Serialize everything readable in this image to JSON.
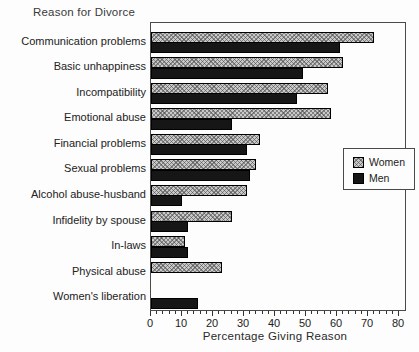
{
  "chart_data": {
    "type": "bar",
    "orientation": "horizontal",
    "title": "Reason for Divorce",
    "xlabel": "Percentage Giving Reason",
    "xlim": [
      0,
      80
    ],
    "xticks": [
      0,
      10,
      20,
      30,
      40,
      50,
      60,
      70,
      80
    ],
    "minor_tick_step": 2,
    "grid": false,
    "legend_position": "right-middle",
    "categories": [
      "Communication problems",
      "Basic unhappiness",
      "Incompatibility",
      "Emotional abuse",
      "Financial problems",
      "Sexual problems",
      "Alcohol abuse-husband",
      "Infidelity by spouse",
      "In-laws",
      "Physical abuse",
      "Women's liberation"
    ],
    "series": [
      {
        "name": "Women",
        "values": [
          72,
          62,
          57,
          58,
          35,
          34,
          31,
          26,
          11,
          23,
          0
        ]
      },
      {
        "name": "Men",
        "values": [
          61,
          49,
          47,
          26,
          31,
          32,
          10,
          12,
          12,
          0,
          15
        ]
      }
    ],
    "colors": {
      "women_fill": "#c9c9c9",
      "women_hatch": "#464646",
      "men_fill": "#161616",
      "outline": "#000000",
      "axis": "#4a4a4a",
      "text": "#222222",
      "background": "#fdfdfd"
    }
  }
}
